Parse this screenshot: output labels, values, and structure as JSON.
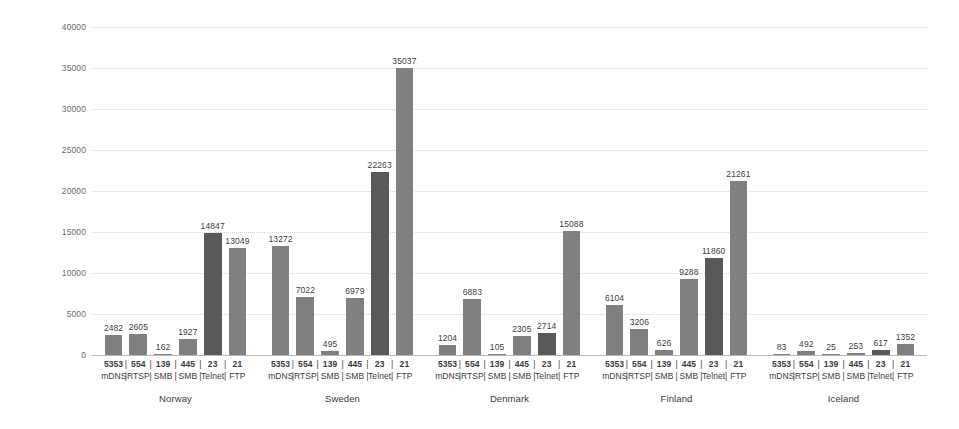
{
  "chart_data": {
    "type": "bar",
    "title": "",
    "subtitle": "",
    "xlabel": "",
    "ylabel": "",
    "ylim": [
      0,
      40000
    ],
    "ytick_labels": [
      "0",
      "5000",
      "10000",
      "15000",
      "20000",
      "25000",
      "30000",
      "35000",
      "40000"
    ],
    "ytick_values": [
      0,
      5000,
      10000,
      15000,
      20000,
      25000,
      30000,
      35000,
      40000
    ],
    "grid": true,
    "legend": "none",
    "groups": [
      "Norway",
      "Sweden",
      "Denmark",
      "Finland",
      "Iceland"
    ],
    "categories": [
      {
        "port": "5353",
        "service": "mDNS"
      },
      {
        "port": "554",
        "service": "RTSP"
      },
      {
        "port": "139",
        "service": "SMB"
      },
      {
        "port": "445",
        "service": "SMB"
      },
      {
        "port": "23",
        "service": "Telnet"
      },
      {
        "port": "21",
        "service": "FTP"
      }
    ],
    "series": [
      {
        "name": "Norway",
        "values": [
          2482,
          2605,
          162,
          1927,
          14847,
          13049
        ]
      },
      {
        "name": "Sweden",
        "values": [
          13272,
          7022,
          495,
          6979,
          22263,
          35037
        ]
      },
      {
        "name": "Denmark",
        "values": [
          1204,
          6883,
          105,
          2305,
          2714,
          15088
        ]
      },
      {
        "name": "Finland",
        "values": [
          6104,
          3206,
          626,
          9288,
          11860,
          21261
        ]
      },
      {
        "name": "Iceland",
        "values": [
          83,
          492,
          25,
          253,
          617,
          1352
        ]
      }
    ],
    "bar_colors": {
      "default": "#808080",
      "highlight": "#595959",
      "highlight_category_index": 4
    },
    "separators": [
      "|",
      "|",
      "|",
      "|",
      "|"
    ]
  }
}
